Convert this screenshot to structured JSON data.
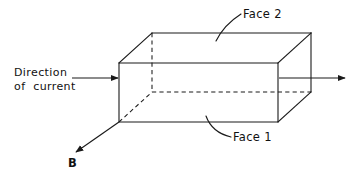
{
  "figure": {
    "background_color": "#ffffff",
    "line_color": "#1a1a1a"
  },
  "labels": {
    "current_line1": "Direction",
    "current_line2": "of  current",
    "face_top": "Face 2",
    "face_bottom": "Face 1",
    "magnetic_field": "B"
  },
  "geometry": {
    "front_face": {
      "top_left_x": 119,
      "top_left_y": 63,
      "top_right_x": 278,
      "top_right_y": 63,
      "bottom_right_x": 278,
      "bottom_right_y": 122,
      "bottom_left_x": 119,
      "bottom_left_y": 122
    },
    "back_face": {
      "top_left_x": 152,
      "top_left_y": 33,
      "top_right_x": 311,
      "top_right_y": 33,
      "bottom_right_x": 311,
      "bottom_right_y": 92,
      "bottom_left_x": 152,
      "bottom_left_y": 92
    },
    "hidden_edges": [
      "back-vertical-left",
      "back-bottom-horizontal",
      "bottom-left-diagonal"
    ]
  },
  "annotations": {
    "current_arrow_in": {
      "from_x": 72,
      "from_y": 78,
      "to_x": 119,
      "to_y": 78
    },
    "current_arrow_out": {
      "from_x": 278,
      "from_y": 78,
      "to_x": 345,
      "to_y": 78
    },
    "field_arrow": {
      "from_x": 119,
      "from_y": 122,
      "to_x": 75,
      "to_y": 153
    },
    "leader_face2": {
      "from_x": 216,
      "from_y": 40,
      "to_x": 241,
      "to_y": 14
    },
    "leader_face1": {
      "from_x": 206,
      "from_y": 117,
      "to_x": 230,
      "to_y": 137
    }
  }
}
